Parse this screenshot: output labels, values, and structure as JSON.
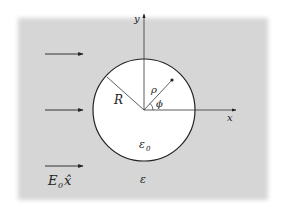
{
  "diagram": {
    "type": "dielectric-cylinder-in-uniform-field",
    "colors": {
      "background": "#ffffff",
      "medium": "#d6d6d6",
      "cylinder": "#ffffff",
      "stroke": "#222222"
    },
    "axes": {
      "x_label": "x",
      "y_label": "y"
    },
    "labels": {
      "radius": "R",
      "radial_coordinate": "ρ",
      "angle": "ϕ",
      "inner_permittivity": "ε",
      "inner_permittivity_sub": "0",
      "outer_permittivity": "ε",
      "field_E": "E",
      "field_E_sub": "0",
      "field_dir": "x̂"
    },
    "field_arrows": [
      {
        "y": 54
      },
      {
        "y": 110
      },
      {
        "y": 166
      }
    ]
  }
}
